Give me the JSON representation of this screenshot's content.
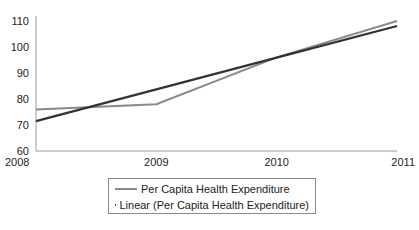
{
  "chart_data": {
    "type": "line",
    "title": "",
    "xlabel": "",
    "ylabel": "",
    "categories": [
      "2008",
      "2009",
      "2010",
      "2011"
    ],
    "x": [
      2008,
      2009,
      2010,
      2011
    ],
    "series": [
      {
        "name": "Per Capita Health Expenditure",
        "values": [
          76,
          78,
          96,
          110
        ],
        "color": "#8a8a8a"
      },
      {
        "name": "Linear (Per Capita Health Expenditure)",
        "values": [
          71.5,
          83.7,
          95.9,
          108.1
        ],
        "color": "#333333"
      }
    ],
    "ylim": [
      60,
      110
    ],
    "yticks": [
      60,
      70,
      80,
      90,
      100,
      110
    ],
    "grid": false,
    "legend_position": "bottom"
  },
  "legend": {
    "items": [
      {
        "label": "Per Capita Health Expenditure",
        "color": "#8a8a8a"
      },
      {
        "label": "Linear (Per Capita Health Expenditure)",
        "color": "#333333"
      }
    ]
  }
}
